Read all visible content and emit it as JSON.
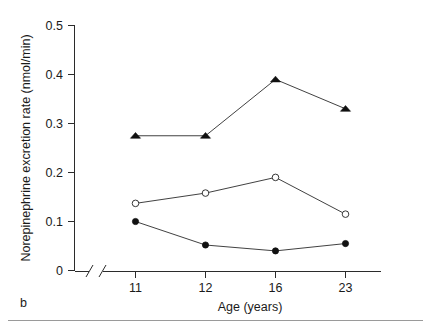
{
  "figure": {
    "panel_label": "b",
    "background_color": "#ffffff",
    "line_color": "#2b2b2b"
  },
  "chart_data": {
    "type": "line",
    "title": "",
    "xlabel": "Age (years)",
    "ylabel": "Norepinephrine excretion rate (nmol/min)",
    "categories": [
      "11",
      "12",
      "16",
      "23"
    ],
    "x_tick_labels": [
      "11",
      "12",
      "16",
      "23"
    ],
    "y_tick_labels": [
      "0",
      "0.1",
      "0.2",
      "0.3",
      "0.4",
      "0.5"
    ],
    "y_tick_values": [
      0,
      0.1,
      0.2,
      0.3,
      0.4,
      0.5
    ],
    "ylim": [
      0,
      0.5
    ],
    "grid": false,
    "legend": "none",
    "axis_break_x": true,
    "series": [
      {
        "name": "filled-triangle-series",
        "marker": "filled-triangle",
        "values": [
          0.275,
          0.275,
          0.39,
          0.33
        ]
      },
      {
        "name": "open-circle-series",
        "marker": "open-circle",
        "values": [
          0.137,
          0.158,
          0.19,
          0.115
        ]
      },
      {
        "name": "filled-circle-series",
        "marker": "filled-circle",
        "values": [
          0.1,
          0.052,
          0.04,
          0.055
        ]
      }
    ]
  }
}
